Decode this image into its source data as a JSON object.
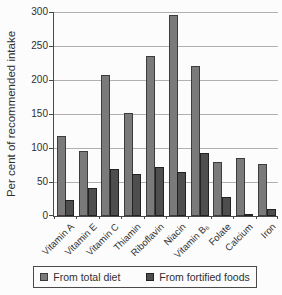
{
  "chart_data": {
    "type": "bar",
    "title": "",
    "xlabel": "",
    "ylabel": "Per cent of recommended intake",
    "ylim": [
      0,
      300
    ],
    "yticks": [
      0,
      50,
      100,
      150,
      200,
      250,
      300
    ],
    "grid": true,
    "legend_position": "bottom",
    "categories": [
      "Vitamin A",
      "Vitamin E",
      "Vitamin C",
      "Thiamin",
      "Riboflavin",
      "Niacin",
      "Vitamin B₆",
      "Folate",
      "Calcium",
      "Iron"
    ],
    "series": [
      {
        "name": "From total diet",
        "color": "#7a7a7a",
        "border_color": "#3c3c3c",
        "values": [
          118,
          96,
          207,
          152,
          235,
          295,
          221,
          79,
          86,
          77
        ]
      },
      {
        "name": "From fortified foods",
        "color": "#4e4e4e",
        "border_color": "#222222",
        "values": [
          23,
          41,
          69,
          62,
          72,
          65,
          93,
          28,
          3,
          11
        ]
      }
    ],
    "colors": {
      "background": "#fcfcfc",
      "gridline": "#b0b0b0",
      "axis": "#4a4a4a",
      "text": "#2f2f2f"
    }
  }
}
